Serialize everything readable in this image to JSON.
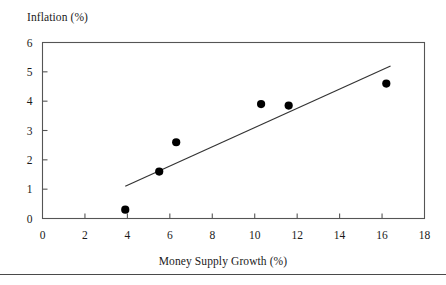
{
  "chart_data": {
    "type": "scatter",
    "title": "",
    "xlabel": "Money Supply Growth (%)",
    "ylabel": "Inflation (%)",
    "xlim": [
      0,
      18
    ],
    "ylim": [
      0,
      6
    ],
    "xticks": [
      "0",
      "2",
      "4",
      "6",
      "8",
      "10",
      "12",
      "14",
      "16",
      "18"
    ],
    "yticks": [
      "0",
      "1",
      "2",
      "3",
      "4",
      "5",
      "6"
    ],
    "grid": false,
    "legend": "none",
    "points": [
      {
        "x": 3.9,
        "y": 0.3
      },
      {
        "x": 5.5,
        "y": 1.6
      },
      {
        "x": 6.3,
        "y": 2.6
      },
      {
        "x": 10.3,
        "y": 3.9
      },
      {
        "x": 11.6,
        "y": 3.85
      },
      {
        "x": 16.2,
        "y": 4.6
      }
    ],
    "trendline": {
      "x_start": 3.9,
      "y_start": 1.1,
      "x_end": 16.4,
      "y_end": 5.2
    },
    "marker_color": "#000000",
    "line_color": "#333333",
    "axis_color": "#555555"
  },
  "footer": {
    "rule_color": "#4a4a4a"
  }
}
